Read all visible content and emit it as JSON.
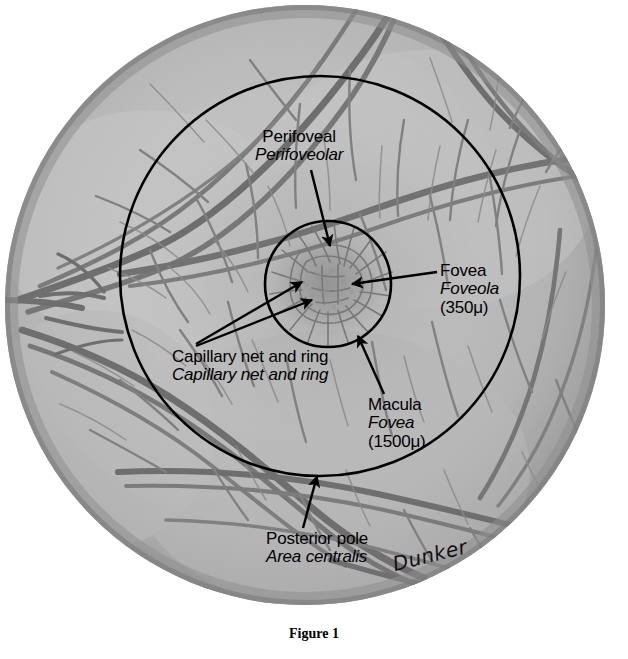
{
  "figure": {
    "caption": "Figure 1",
    "signature": "Dunker"
  },
  "labels": {
    "perifoveal": {
      "line1": "Perifoveal",
      "line2": "Perifoveolar"
    },
    "fovea": {
      "line1": "Fovea",
      "line2": "Foveola",
      "line3": "(350μ)"
    },
    "capillary": {
      "line1": "Capillary net and ring",
      "line2": "Capillary net and ring"
    },
    "macula": {
      "line1": "Macula",
      "line2": "Fovea",
      "line3": "(1500μ)"
    },
    "posterior": {
      "line1": "Posterior pole",
      "line2": "Area centralis"
    }
  },
  "colors": {
    "fundus_light": "#c3c3c3",
    "fundus_mid": "#b2b2b2",
    "fundus_rim": "#8d8d8d",
    "vessel": "#6f6f6f",
    "vessel_dark": "#5a5a5a",
    "capillary": "#7d7d7d",
    "ink": "#000000",
    "background": "#ffffff"
  },
  "geometry": {
    "fundus_center_x": 305,
    "fundus_center_y": 305,
    "fundus_radius_x": 300,
    "fundus_radius_y": 300,
    "macula_ring_center_x": 320,
    "macula_ring_center_y": 276,
    "macula_ring_radius": 200,
    "fovea_ring_center_x": 328,
    "fovea_ring_center_y": 284,
    "fovea_ring_radius": 63
  }
}
